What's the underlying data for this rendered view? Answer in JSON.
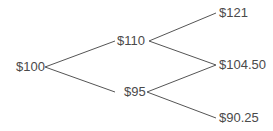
{
  "diagram": {
    "type": "binomial-tree",
    "colors": {
      "line": "#555555",
      "text": "#4a4a4a"
    },
    "nodes": {
      "root": "$100",
      "up": "$110",
      "down": "$95",
      "up_up": "$121",
      "up_down": "$104.50",
      "down_down": "$90.25"
    },
    "edges": [
      [
        "root",
        "up"
      ],
      [
        "root",
        "down"
      ],
      [
        "up",
        "up_up"
      ],
      [
        "up",
        "up_down"
      ],
      [
        "down",
        "up_down"
      ],
      [
        "down",
        "down_down"
      ]
    ]
  }
}
